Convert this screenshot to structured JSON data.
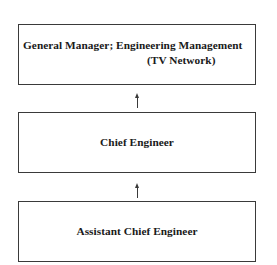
{
  "diagram": {
    "type": "organizational-hierarchy",
    "nodes": [
      {
        "id": "general-manager",
        "label_line1": "General Manager; Engineering Management",
        "label_line2": "(TV Network)"
      },
      {
        "id": "chief-engineer",
        "label": "Chief Engineer"
      },
      {
        "id": "assistant-chief-engineer",
        "label": "Assistant Chief Engineer"
      }
    ],
    "edges": [
      {
        "from": "chief-engineer",
        "to": "general-manager",
        "style": "arrow-up"
      },
      {
        "from": "assistant-chief-engineer",
        "to": "chief-engineer",
        "style": "arrow-up"
      }
    ],
    "colors": {
      "line": "#3a3a3a",
      "text": "#1a1a1a",
      "background": "#ffffff"
    }
  }
}
